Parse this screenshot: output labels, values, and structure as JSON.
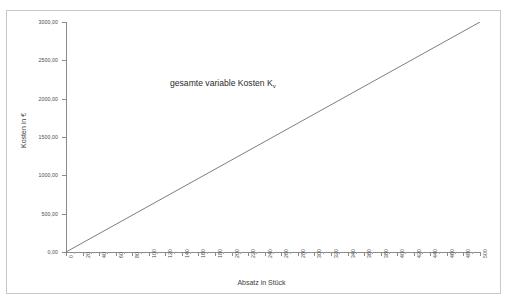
{
  "chart_data": {
    "type": "line",
    "title": "",
    "xlabel": "Absatz in Stück",
    "ylabel": "Kosten in €",
    "xlim": [
      0,
      500
    ],
    "ylim": [
      0,
      3000
    ],
    "grid": false,
    "legend_position": "none",
    "x_tick_step": 20,
    "x_minor_tick_step": 10,
    "y_tick_step": 500,
    "x_ticks": [
      "0",
      "20",
      "40",
      "60",
      "80",
      "100",
      "120",
      "140",
      "160",
      "180",
      "200",
      "220",
      "240",
      "260",
      "280",
      "300",
      "320",
      "340",
      "360",
      "380",
      "400",
      "420",
      "440",
      "460",
      "480",
      "500"
    ],
    "y_ticks": [
      "0,00",
      "500,00",
      "1000,00",
      "1500,00",
      "2000,00",
      "2500,00",
      "3000,00"
    ],
    "series": [
      {
        "name": "gesamte variable Kosten Kv",
        "color": "#6e6e6e",
        "slope_per_unit": 6,
        "x": [
          0,
          500
        ],
        "values": [
          0,
          3000
        ]
      }
    ],
    "annotations": [
      {
        "text_main": "gesamte variable Kosten K",
        "text_sub": "v",
        "x": 200,
        "y": 2250
      }
    ]
  },
  "style": {
    "frame_border_color": "#c9c9c9",
    "axis_color": "#8a8a8a",
    "line_color": "#6e6e6e",
    "text_color": "#4a4a4a",
    "background": "#ffffff"
  }
}
